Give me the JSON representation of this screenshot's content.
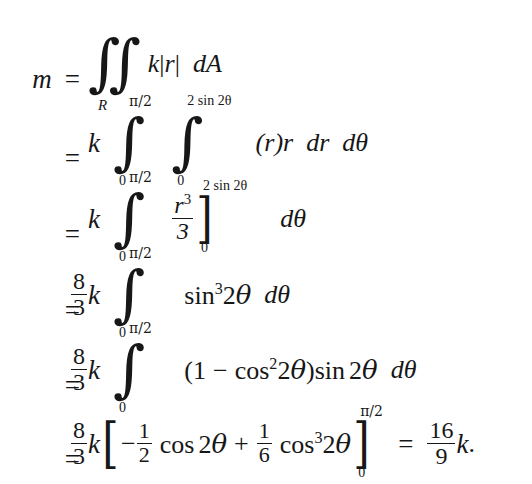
{
  "document": {
    "type": "mathematical-derivation",
    "subject": "Mass of a lamina via double integral in polar coordinates",
    "background_color": "#ffffff",
    "text_color": "#171717",
    "result": "16/9 k"
  },
  "equation": {
    "lines": [
      {
        "id": "line-1",
        "lhs": "m",
        "relation": "=",
        "integral": {
          "symbol": "double-integral",
          "region_subscript": "R"
        },
        "integrand": "k|r|",
        "differential": "dA",
        "plain_text": "m = ∬_R k|r| dA"
      },
      {
        "id": "line-2",
        "lhs": "",
        "relation": "=",
        "coefficient": "k",
        "integrals": [
          {
            "lower": "0",
            "upper": "π/2"
          },
          {
            "lower": "0",
            "upper": "2 sin 2θ"
          }
        ],
        "integrand": "(r)r",
        "differential": "dr dθ",
        "plain_text": "= k ∫_0^{π/2} ∫_0^{2 sin 2θ} (r)r dr dθ"
      },
      {
        "id": "line-3",
        "lhs": "",
        "relation": "=",
        "coefficient": "k",
        "integrals": [
          {
            "lower": "0",
            "upper": "π/2"
          }
        ],
        "evaluated": {
          "numerator": "r",
          "numerator_exponent": "3",
          "denominator": "3",
          "bracket_lower": "0",
          "bracket_upper": "2 sin 2θ"
        },
        "differential": "dθ",
        "plain_text": "= k ∫_0^{π/2} [r³/3]_0^{2 sin 2θ} dθ"
      },
      {
        "id": "line-4",
        "lhs": "",
        "relation": "=",
        "coefficient": {
          "numerator": "8",
          "denominator": "3",
          "variable": "k"
        },
        "integrals": [
          {
            "lower": "0",
            "upper": "π/2"
          }
        ],
        "integrand": "sin³2θ",
        "differential": "dθ",
        "plain_text": "= (8/3)k ∫_0^{π/2} sin³ 2θ dθ"
      },
      {
        "id": "line-5",
        "lhs": "",
        "relation": "=",
        "coefficient": {
          "numerator": "8",
          "denominator": "3",
          "variable": "k"
        },
        "integrals": [
          {
            "lower": "0",
            "upper": "π/2"
          }
        ],
        "integrand": "(1 − cos²2θ)sin 2θ",
        "differential": "dθ",
        "plain_text": "= (8/3)k ∫_0^{π/2} (1 − cos² 2θ) sin 2θ dθ"
      },
      {
        "id": "line-6",
        "lhs": "",
        "relation": "=",
        "coefficient": {
          "numerator": "8",
          "denominator": "3",
          "variable": "k"
        },
        "antiderivative": {
          "term1": {
            "sign": "−",
            "numerator": "1",
            "denominator": "2",
            "function": "cos 2θ"
          },
          "operator": "+",
          "term2": {
            "numerator": "1",
            "denominator": "6",
            "function": "cos³2θ"
          },
          "bracket_lower": "0",
          "bracket_upper": "π/2"
        },
        "final_relation": "=",
        "final_value": {
          "numerator": "16",
          "denominator": "9",
          "variable": "k",
          "punctuation": "."
        },
        "plain_text": "= (8/3)k[ −(1/2) cos 2θ + (1/6) cos³ 2θ ]_0^{π/2} = (16/9)k."
      }
    ],
    "symbols": {
      "m": "m",
      "k": "k",
      "r": "r",
      "dA": "dA",
      "dr": "dr",
      "dtheta": "dθ",
      "theta": "θ",
      "equals": "=",
      "plus": "+",
      "minus": "−",
      "pi_over_2": "π/2",
      "zero": "0",
      "R": "R",
      "two_sin_two_theta": "2 sin 2θ",
      "sin": "sin",
      "cos": "cos",
      "abs_bar": "|",
      "lparen": "(",
      "rparen": ")",
      "lbracket": "[",
      "rbracket": "]",
      "integral": "∫",
      "double_integral": "∬",
      "period": ".",
      "one": "1",
      "two": "2",
      "three": "3",
      "six": "6",
      "eight": "8",
      "nine": "9",
      "sixteen": "16",
      "exp_two": "2",
      "exp_three": "3"
    }
  }
}
